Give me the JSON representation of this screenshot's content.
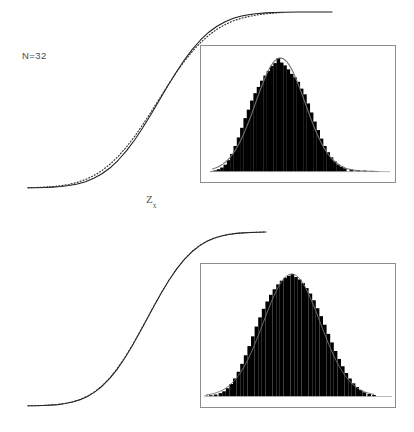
{
  "figure": {
    "title": "",
    "background_color": "#ffffff",
    "width": 414,
    "height": 432
  },
  "panels": [
    {
      "id": "panel-top",
      "n_label": "N=32",
      "axis_label_base": "Z",
      "axis_label_sub": "x"
    },
    {
      "id": "panel-bot",
      "n_label": "N=32",
      "axis_label_base": "Z",
      "axis_label_sub": "y"
    }
  ],
  "chart_data": [
    {
      "type": "line",
      "name": "cumulative-distribution-zx",
      "title": "",
      "xlabel": "Zx",
      "ylabel": "",
      "annotations": [
        "N=32"
      ],
      "grid": false,
      "legend": "none",
      "xlim": [
        -3.2,
        4.2
      ],
      "ylim": [
        0,
        1
      ],
      "series": [
        {
          "name": "theoretical-cdf",
          "style": "solid-line",
          "color": "#1a1a1a",
          "x": [
            -3.2,
            -3.0,
            -2.8,
            -2.6,
            -2.4,
            -2.2,
            -2.0,
            -1.8,
            -1.6,
            -1.4,
            -1.2,
            -1.0,
            -0.8,
            -0.6,
            -0.4,
            -0.2,
            0.0,
            0.2,
            0.4,
            0.6,
            0.8,
            1.0,
            1.2,
            1.4,
            1.6,
            1.8,
            2.0,
            2.2,
            2.4,
            2.6,
            2.8,
            3.0,
            3.4,
            3.8,
            4.2
          ],
          "y": [
            0.001,
            0.001,
            0.003,
            0.005,
            0.008,
            0.014,
            0.023,
            0.036,
            0.055,
            0.081,
            0.115,
            0.159,
            0.212,
            0.274,
            0.345,
            0.421,
            0.5,
            0.579,
            0.655,
            0.726,
            0.788,
            0.841,
            0.885,
            0.919,
            0.945,
            0.964,
            0.977,
            0.986,
            0.992,
            0.995,
            0.997,
            0.999,
            1.0,
            1.0,
            1.0
          ]
        },
        {
          "name": "empirical-cdf-dotted",
          "style": "dotted-line",
          "color": "#2a2a2a",
          "x": [
            -3.2,
            -3.0,
            -2.8,
            -2.6,
            -2.4,
            -2.2,
            -2.0,
            -1.8,
            -1.6,
            -1.4,
            -1.2,
            -1.0,
            -0.8,
            -0.6,
            -0.4,
            -0.2,
            0.0,
            0.2,
            0.4,
            0.6,
            0.8,
            1.0,
            1.2,
            1.4,
            1.6,
            1.8,
            2.0,
            2.2,
            2.4,
            2.6,
            2.8,
            3.0
          ],
          "y": [
            0.002,
            0.003,
            0.005,
            0.008,
            0.013,
            0.021,
            0.032,
            0.048,
            0.07,
            0.099,
            0.136,
            0.181,
            0.234,
            0.295,
            0.362,
            0.434,
            0.508,
            0.582,
            0.653,
            0.718,
            0.776,
            0.826,
            0.868,
            0.902,
            0.929,
            0.95,
            0.965,
            0.976,
            0.984,
            0.99,
            0.994,
            0.997
          ]
        }
      ],
      "inset": {
        "type": "bar",
        "name": "histogram-zx",
        "frame": true,
        "overlay_curve": "normal-density",
        "overlay_curve_color": "#6b6b6b",
        "bar_color": "#000000",
        "bin_centers": [
          -3.0,
          -2.85,
          -2.7,
          -2.55,
          -2.4,
          -2.25,
          -2.1,
          -1.95,
          -1.8,
          -1.65,
          -1.5,
          -1.35,
          -1.2,
          -1.05,
          -0.9,
          -0.75,
          -0.6,
          -0.45,
          -0.3,
          -0.15,
          0.0,
          0.15,
          0.3,
          0.45,
          0.6,
          0.75,
          0.9,
          1.05,
          1.2,
          1.35,
          1.5,
          1.65,
          1.8,
          1.95,
          2.1,
          2.25,
          2.4,
          2.55,
          2.7,
          2.85,
          3.0,
          3.3,
          3.6,
          3.9,
          4.2,
          4.5
        ],
        "values": [
          0.005,
          0.01,
          0.02,
          0.035,
          0.06,
          0.1,
          0.155,
          0.225,
          0.3,
          0.385,
          0.47,
          0.545,
          0.625,
          0.69,
          0.745,
          0.8,
          0.845,
          0.885,
          0.93,
          0.955,
          1.0,
          0.96,
          0.935,
          0.9,
          0.86,
          0.83,
          0.79,
          0.73,
          0.68,
          0.6,
          0.52,
          0.44,
          0.365,
          0.29,
          0.225,
          0.17,
          0.125,
          0.09,
          0.062,
          0.042,
          0.028,
          0.018,
          0.012,
          0.008,
          0.005,
          0.003
        ]
      }
    },
    {
      "type": "line",
      "name": "cumulative-distribution-zy",
      "title": "",
      "xlabel": "Zy",
      "ylabel": "",
      "annotations": [
        "N=32"
      ],
      "grid": false,
      "legend": "none",
      "xlim": [
        -3.2,
        3.2
      ],
      "ylim": [
        0,
        1
      ],
      "series": [
        {
          "name": "theoretical-cdf",
          "style": "solid-line",
          "color": "#1a1a1a",
          "x": [
            -3.2,
            -3.0,
            -2.8,
            -2.6,
            -2.4,
            -2.2,
            -2.0,
            -1.8,
            -1.6,
            -1.4,
            -1.2,
            -1.0,
            -0.8,
            -0.6,
            -0.4,
            -0.2,
            0.0,
            0.2,
            0.4,
            0.6,
            0.8,
            1.0,
            1.2,
            1.4,
            1.6,
            1.8,
            2.0,
            2.2,
            2.4,
            2.6,
            2.8,
            3.0,
            3.2
          ],
          "y": [
            0.001,
            0.001,
            0.003,
            0.005,
            0.008,
            0.014,
            0.023,
            0.036,
            0.055,
            0.081,
            0.115,
            0.159,
            0.212,
            0.274,
            0.345,
            0.421,
            0.5,
            0.579,
            0.655,
            0.726,
            0.788,
            0.841,
            0.885,
            0.919,
            0.945,
            0.964,
            0.977,
            0.986,
            0.992,
            0.995,
            0.997,
            0.999,
            1.0
          ]
        },
        {
          "name": "empirical-cdf-dotted",
          "style": "dotted-line",
          "color": "#2a2a2a",
          "x": [
            -3.2,
            -3.0,
            -2.8,
            -2.6,
            -2.4,
            -2.2,
            -2.0,
            -1.8,
            -1.6,
            -1.4,
            -1.2,
            -1.0,
            -0.8,
            -0.6,
            -0.4,
            -0.2,
            0.0,
            0.2,
            0.4,
            0.6,
            0.8,
            1.0,
            1.2,
            1.4,
            1.6,
            1.8,
            2.0,
            2.2,
            2.4,
            2.6,
            2.8,
            3.0,
            3.2
          ],
          "y": [
            0.001,
            0.002,
            0.003,
            0.006,
            0.009,
            0.015,
            0.025,
            0.038,
            0.058,
            0.084,
            0.119,
            0.163,
            0.217,
            0.279,
            0.349,
            0.425,
            0.503,
            0.582,
            0.657,
            0.727,
            0.79,
            0.843,
            0.887,
            0.921,
            0.946,
            0.965,
            0.978,
            0.987,
            0.992,
            0.996,
            0.998,
            0.999,
            1.0
          ]
        }
      ],
      "inset": {
        "type": "bar",
        "name": "histogram-zy",
        "frame": true,
        "overlay_curve": "normal-density",
        "overlay_curve_color": "#6b6b6b",
        "bar_color": "#000000",
        "bin_centers": [
          -3.6,
          -3.4,
          -3.2,
          -3.0,
          -2.85,
          -2.7,
          -2.55,
          -2.4,
          -2.25,
          -2.1,
          -1.95,
          -1.8,
          -1.65,
          -1.5,
          -1.35,
          -1.2,
          -1.05,
          -0.9,
          -0.75,
          -0.6,
          -0.45,
          -0.3,
          -0.15,
          0.0,
          0.15,
          0.3,
          0.45,
          0.6,
          0.75,
          0.9,
          1.05,
          1.2,
          1.35,
          1.5,
          1.65,
          1.8,
          1.95,
          2.1,
          2.25,
          2.4,
          2.55,
          2.7,
          2.85,
          3.0,
          3.2,
          3.4
        ],
        "values": [
          0.004,
          0.008,
          0.014,
          0.025,
          0.04,
          0.065,
          0.1,
          0.145,
          0.2,
          0.265,
          0.335,
          0.41,
          0.49,
          0.57,
          0.645,
          0.715,
          0.775,
          0.83,
          0.875,
          0.915,
          0.945,
          0.97,
          0.985,
          1.0,
          0.975,
          0.955,
          0.925,
          0.885,
          0.84,
          0.785,
          0.72,
          0.655,
          0.585,
          0.51,
          0.44,
          0.37,
          0.305,
          0.245,
          0.19,
          0.145,
          0.105,
          0.075,
          0.05,
          0.032,
          0.018,
          0.01
        ]
      }
    }
  ]
}
